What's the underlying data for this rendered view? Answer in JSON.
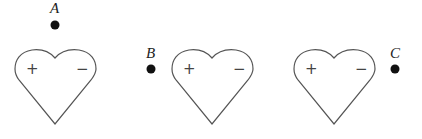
{
  "diagram": {
    "hearts": [
      {
        "id": "heart-1",
        "offset_x": 0,
        "plus": "+",
        "minus": "−"
      },
      {
        "id": "heart-2",
        "offset_x": 157,
        "plus": "+",
        "minus": "−"
      },
      {
        "id": "heart-3",
        "offset_x": 279,
        "plus": "+",
        "minus": "−"
      }
    ],
    "points": [
      {
        "label": "A",
        "x": 55,
        "y": 25
      },
      {
        "label": "B",
        "x": 151,
        "y": 69
      },
      {
        "label": "C",
        "x": 395,
        "y": 69
      }
    ]
  }
}
